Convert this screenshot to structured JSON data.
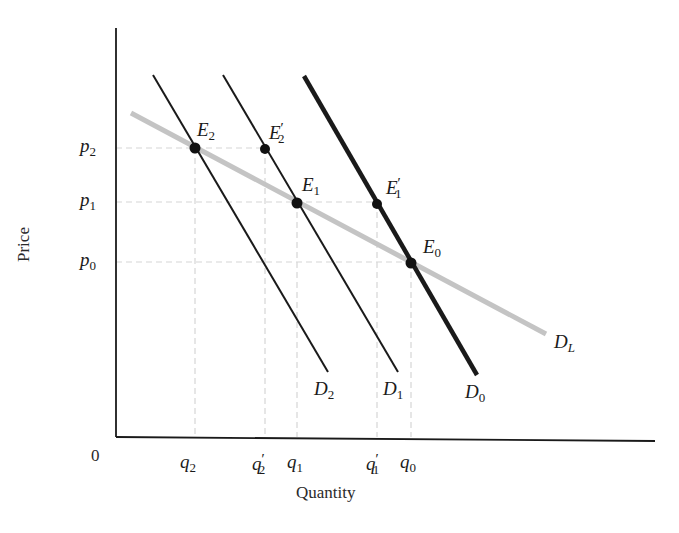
{
  "figure": {
    "x_axis_title": "Quantity",
    "y_axis_title": "Price",
    "origin_label": "0",
    "colors": {
      "axis": "#1a1a1a",
      "demand_curves": "#1a1a1a",
      "long_run_demand": "#c4c4c4",
      "guide_lines": "#d4d4d4",
      "points": "#111111"
    },
    "y_ticks": [
      {
        "base": "p",
        "sub": "2",
        "prime": ""
      },
      {
        "base": "p",
        "sub": "1",
        "prime": ""
      },
      {
        "base": "p",
        "sub": "0",
        "prime": ""
      }
    ],
    "x_ticks": [
      {
        "base": "q",
        "sub": "2",
        "prime": ""
      },
      {
        "base": "q",
        "sub": "2",
        "prime": "′"
      },
      {
        "base": "q",
        "sub": "1",
        "prime": ""
      },
      {
        "base": "q",
        "sub": "1",
        "prime": "′"
      },
      {
        "base": "q",
        "sub": "0",
        "prime": ""
      }
    ],
    "curves": [
      {
        "base": "D",
        "sub": "2",
        "style": "thin"
      },
      {
        "base": "D",
        "sub": "1",
        "style": "thin"
      },
      {
        "base": "D",
        "sub": "0",
        "style": "thick"
      },
      {
        "base": "D",
        "sub": "L",
        "style": "gray-long-run"
      }
    ],
    "points": [
      {
        "base": "E",
        "sub": "2",
        "prime": "",
        "on": "D2 ∩ DL",
        "price": "p2",
        "quantity": "q2"
      },
      {
        "base": "E",
        "sub": "2",
        "prime": "′",
        "on": "D1",
        "price": "p2",
        "quantity": "q2′"
      },
      {
        "base": "E",
        "sub": "1",
        "prime": "",
        "on": "D1 ∩ DL",
        "price": "p1",
        "quantity": "q1"
      },
      {
        "base": "E",
        "sub": "1",
        "prime": "′",
        "on": "D0",
        "price": "p1",
        "quantity": "q1′"
      },
      {
        "base": "E",
        "sub": "0",
        "prime": "",
        "on": "D0 ∩ DL",
        "price": "p0",
        "quantity": "q0"
      }
    ]
  }
}
